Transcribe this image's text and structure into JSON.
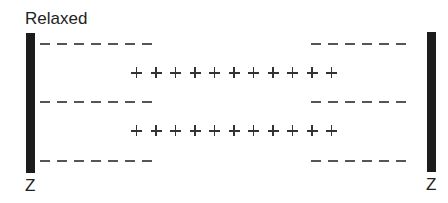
{
  "diagram": {
    "title": "Relaxed",
    "left_label": "Z",
    "right_label": "Z",
    "z_discs": [
      {
        "side": "left",
        "color": "#1c1c1c"
      },
      {
        "side": "right",
        "color": "#1c1c1c"
      }
    ],
    "thin_filament_rows": [
      {
        "row": 1,
        "left_dashes": 7,
        "right_dashes": 6,
        "symbol": "-"
      },
      {
        "row": 2,
        "left_dashes": 7,
        "right_dashes": 6,
        "symbol": "-"
      },
      {
        "row": 3,
        "left_dashes": 7,
        "right_dashes": 6,
        "symbol": "-"
      }
    ],
    "thick_filament_rows": [
      {
        "row": 1,
        "count": 11,
        "symbol": "+"
      },
      {
        "row": 2,
        "count": 11,
        "symbol": "+"
      }
    ]
  }
}
